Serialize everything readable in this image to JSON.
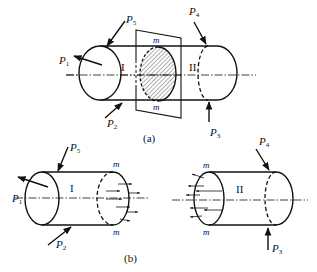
{
  "figure": {
    "colors": {
      "stroke": "#111111",
      "background": "#ffffff",
      "hatch": "#333333"
    }
  },
  "part_a": {
    "caption": "(a)",
    "section_label_top": "m",
    "section_label_bottom": "m",
    "part_left": "I",
    "part_right": "II",
    "forces": [
      {
        "symbol": "P",
        "sub": "1"
      },
      {
        "symbol": "P",
        "sub": "2"
      },
      {
        "symbol": "P",
        "sub": "3"
      },
      {
        "symbol": "P",
        "sub": "4"
      },
      {
        "symbol": "P",
        "sub": "5"
      }
    ]
  },
  "part_b": {
    "caption": "(b)",
    "left_body": {
      "label": "I",
      "section_top": "m",
      "section_bottom": "m",
      "forces": [
        {
          "symbol": "P",
          "sub": "1"
        },
        {
          "symbol": "P",
          "sub": "2"
        },
        {
          "symbol": "P",
          "sub": "5"
        }
      ]
    },
    "right_body": {
      "label": "II",
      "section_top": "m",
      "section_bottom": "m",
      "forces": [
        {
          "symbol": "P",
          "sub": "3"
        },
        {
          "symbol": "P",
          "sub": "4"
        }
      ]
    }
  }
}
